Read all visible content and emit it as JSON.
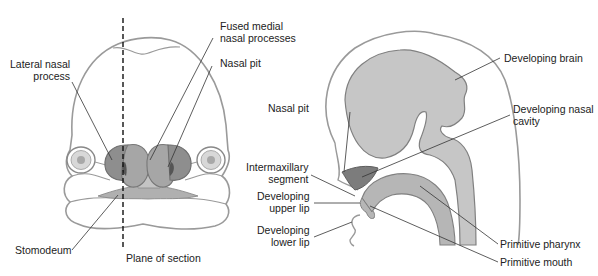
{
  "figure": {
    "left_panel": {
      "name": "frontal-view-face",
      "labels": {
        "lateral_nasal_process": "Lateral nasal\nprocess",
        "fused_medial_nasal_processes": "Fused medial\nnasal processes",
        "nasal_pit": "Nasal pit",
        "stomodeum": "Stomodeum",
        "plane_of_section": "Plane of section"
      }
    },
    "right_panel": {
      "name": "sagittal-section-head",
      "labels": {
        "nasal_pit": "Nasal pit",
        "developing_brain": "Developing brain",
        "developing_nasal_cavity": "Developing nasal\ncavity",
        "intermaxillary_segment": "Intermaxillary\nsegment",
        "developing_upper_lip": "Developing\nupper lip",
        "developing_lower_lip": "Developing\nlower lip",
        "primitive_pharynx": "Primitive pharynx",
        "primitive_mouth": "Primitive mouth"
      }
    },
    "colors": {
      "outline": "#9a9a9a",
      "light_fill": "#c8c8c8",
      "mid_fill": "#a8a8a8",
      "dark_fill": "#7a7a7a",
      "leader_line": "#333333",
      "text": "#222222"
    }
  }
}
